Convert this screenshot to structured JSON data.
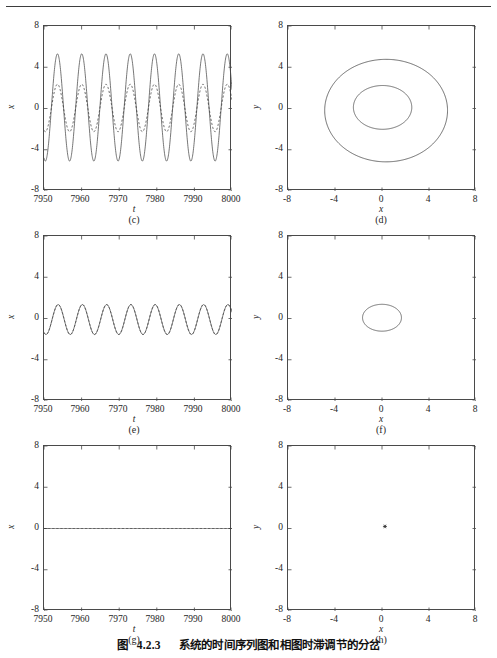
{
  "figure": {
    "caption_prefix": "图",
    "caption_number": "4.2.3",
    "caption_text": "系统的时间序列图和相图时滞调节的分岔",
    "top_rule": true
  },
  "axes": {
    "time_xlabel": "t",
    "time_ylabel": "x",
    "phase_xlabel": "x",
    "phase_ylabel": "y",
    "time_xticks": [
      "7950",
      "7960",
      "7970",
      "7980",
      "7990",
      "8000"
    ],
    "time_yticks": [
      "8",
      "4",
      "0",
      "-4",
      "-8"
    ],
    "phase_xticks": [
      "-8",
      "-4",
      "0",
      "4",
      "8"
    ],
    "phase_yticks": [
      "8",
      "4",
      "0",
      "-4",
      "-8"
    ]
  },
  "panels": [
    {
      "id": "c",
      "label": "(c)",
      "kind": "timeseries"
    },
    {
      "id": "d",
      "label": "(d)",
      "kind": "phase"
    },
    {
      "id": "e",
      "label": "(e)",
      "kind": "timeseries"
    },
    {
      "id": "f",
      "label": "(f)",
      "kind": "phase"
    },
    {
      "id": "g",
      "label": "(g)",
      "kind": "timeseries"
    },
    {
      "id": "h",
      "label": "(h)",
      "kind": "phase"
    }
  ],
  "chart_data": [
    {
      "type": "line",
      "panel": "c",
      "title": "(c)",
      "xlabel": "t",
      "ylabel": "x",
      "xlim": [
        7950,
        8000
      ],
      "ylim": [
        -8,
        8
      ],
      "xticks": [
        7950,
        7960,
        7970,
        7980,
        7990,
        8000
      ],
      "yticks": [
        -8,
        -4,
        0,
        4,
        8
      ],
      "grid": false,
      "legend": "none",
      "series": [
        {
          "name": "x(t) solid",
          "style": "solid",
          "color": "#4a4a4a",
          "waveform": "sinusoid",
          "amplitude": 5.2,
          "offset": 0.1,
          "period": 6.45,
          "phase_deg": -110
        },
        {
          "name": "x(t) dashed",
          "style": "dashed",
          "color": "#3a3a3a",
          "waveform": "sinusoid",
          "amplitude": 2.3,
          "offset": 0.05,
          "period": 6.45,
          "phase_deg": -110
        }
      ]
    },
    {
      "type": "line",
      "panel": "d",
      "title": "(d)",
      "xlabel": "x",
      "ylabel": "y",
      "xlim": [
        -8,
        8
      ],
      "ylim": [
        -8,
        8
      ],
      "xticks": [
        -8,
        -4,
        0,
        4,
        8
      ],
      "yticks": [
        -8,
        -4,
        0,
        4,
        8
      ],
      "grid": false,
      "legend": "none",
      "orbits": [
        {
          "name": "outer limit cycle",
          "cx": 0.35,
          "cy": -0.1,
          "rx": 5.05,
          "ry": 5.15,
          "rotation_deg": 0,
          "color": "#4a4a4a"
        },
        {
          "name": "inner limit cycle",
          "cx": 0.05,
          "cy": 0.15,
          "rx": 2.4,
          "ry": 2.2,
          "rotation_deg": 0,
          "color": "#4a4a4a"
        }
      ]
    },
    {
      "type": "line",
      "panel": "e",
      "title": "(e)",
      "xlabel": "t",
      "ylabel": "x",
      "xlim": [
        7950,
        8000
      ],
      "ylim": [
        -8,
        8
      ],
      "xticks": [
        7950,
        7960,
        7970,
        7980,
        7990,
        8000
      ],
      "yticks": [
        -8,
        -4,
        0,
        4,
        8
      ],
      "grid": false,
      "legend": "none",
      "series": [
        {
          "name": "x(t) solid",
          "style": "solid",
          "color": "#4a4a4a",
          "waveform": "sinusoid",
          "amplitude": 1.45,
          "offset": -0.1,
          "period": 6.45,
          "phase_deg": -120
        },
        {
          "name": "x(t) dashed",
          "style": "dashed",
          "color": "#3a3a3a",
          "waveform": "sinusoid",
          "amplitude": 1.45,
          "offset": -0.1,
          "period": 6.45,
          "phase_deg": -120
        }
      ]
    },
    {
      "type": "line",
      "panel": "f",
      "title": "(f)",
      "xlabel": "x",
      "ylabel": "y",
      "xlim": [
        -8,
        8
      ],
      "ylim": [
        -8,
        8
      ],
      "xticks": [
        -8,
        -4,
        0,
        4,
        8
      ],
      "yticks": [
        -8,
        -4,
        0,
        4,
        8
      ],
      "grid": false,
      "legend": "none",
      "orbits": [
        {
          "name": "limit cycle",
          "cx": 0.0,
          "cy": 0.1,
          "rx": 1.6,
          "ry": 1.35,
          "rotation_deg": 0,
          "color": "#4a4a4a"
        }
      ]
    },
    {
      "type": "line",
      "panel": "g",
      "title": "(g)",
      "xlabel": "t",
      "ylabel": "x",
      "xlim": [
        7950,
        8000
      ],
      "ylim": [
        -8,
        8
      ],
      "xticks": [
        7950,
        7960,
        7970,
        7980,
        7990,
        8000
      ],
      "yticks": [
        -8,
        -4,
        0,
        4,
        8
      ],
      "grid": false,
      "legend": "none",
      "series": [
        {
          "name": "x(t) solid",
          "style": "solid",
          "color": "#4a4a4a",
          "waveform": "constant",
          "amplitude": 0.0,
          "offset": 0.0,
          "period": 0,
          "phase_deg": 0
        },
        {
          "name": "x(t) dashed",
          "style": "dashed",
          "color": "#3a3a3a",
          "waveform": "constant",
          "amplitude": 0.0,
          "offset": 0.0,
          "period": 0,
          "phase_deg": 0
        }
      ]
    },
    {
      "type": "scatter",
      "panel": "h",
      "title": "(h)",
      "xlabel": "x",
      "ylabel": "y",
      "xlim": [
        -8,
        8
      ],
      "ylim": [
        -8,
        8
      ],
      "xticks": [
        -8,
        -4,
        0,
        4,
        8
      ],
      "yticks": [
        -8,
        -4,
        0,
        4,
        8
      ],
      "grid": false,
      "legend": "none",
      "points": [
        {
          "x": 0.25,
          "y": 0.2,
          "marker": "asterisk",
          "color": "#2b2b2b"
        }
      ]
    }
  ]
}
